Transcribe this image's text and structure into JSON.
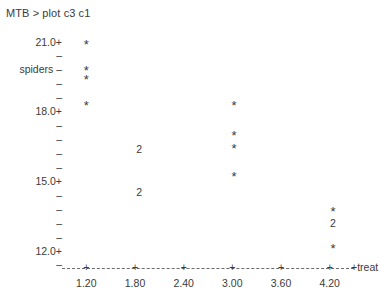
{
  "terminal": {
    "prompt_line": "MTB > plot c3 c1"
  },
  "chart_data": {
    "type": "scatter",
    "title": "MTB > plot c3 c1",
    "xlabel": "treat",
    "ylabel": "spiders",
    "xlim": [
      0.9,
      4.5
    ],
    "ylim": [
      11.4,
      21.3
    ],
    "grid": false,
    "legend": null,
    "xticklabels": [
      "1.20",
      "1.80",
      "2.40",
      "3.00",
      "3.60",
      "4.20"
    ],
    "xtickvalues": [
      1.2,
      1.8,
      2.4,
      3.0,
      3.6,
      4.2
    ],
    "yticklabels": [
      "21.0+",
      "–",
      "spiders –",
      "–",
      "–",
      "18.0+",
      "–",
      "–",
      "–",
      "–",
      "15.0+",
      "–",
      "–",
      "–",
      "–",
      "12.0+",
      "–"
    ],
    "ymajorlabels": [
      "21.0+",
      "18.0+",
      "15.0+",
      "12.0+"
    ],
    "yaxis_title_row_label": "spiders –",
    "xaxis_end_label": "+treat",
    "points": [
      {
        "x": 1.2,
        "y": 21.0,
        "marker": "*",
        "count": 1
      },
      {
        "x": 1.2,
        "y": 19.85,
        "marker": "*",
        "count": 1
      },
      {
        "x": 1.2,
        "y": 19.45,
        "marker": "*",
        "count": 1
      },
      {
        "x": 1.2,
        "y": 18.35,
        "marker": "*",
        "count": 1
      },
      {
        "x": 1.85,
        "y": 16.4,
        "marker": "2",
        "count": 2
      },
      {
        "x": 1.85,
        "y": 14.55,
        "marker": "2",
        "count": 2
      },
      {
        "x": 3.02,
        "y": 18.35,
        "marker": "*",
        "count": 1
      },
      {
        "x": 3.02,
        "y": 17.05,
        "marker": "*",
        "count": 1
      },
      {
        "x": 3.02,
        "y": 16.5,
        "marker": "*",
        "count": 1
      },
      {
        "x": 3.02,
        "y": 15.3,
        "marker": "*",
        "count": 1
      },
      {
        "x": 4.24,
        "y": 13.8,
        "marker": "*",
        "count": 1
      },
      {
        "x": 4.24,
        "y": 13.2,
        "marker": "2",
        "count": 2
      },
      {
        "x": 4.24,
        "y": 12.2,
        "marker": "*",
        "count": 1
      }
    ]
  },
  "colors": {
    "background": "#ffffff",
    "text": "#3b3b3b",
    "axis": "#6a6a6a"
  }
}
